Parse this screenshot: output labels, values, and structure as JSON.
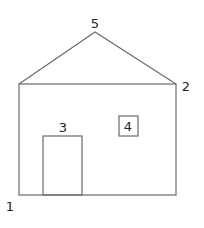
{
  "diagram": {
    "title": "",
    "stroke_color": "#6b6b6b",
    "label_color": "#222222",
    "shapes": {
      "wall": {
        "x": 19,
        "y": 84,
        "width": 157,
        "height": 111
      },
      "roof": {
        "points": [
          [
            19,
            84
          ],
          [
            95,
            32
          ],
          [
            176,
            84
          ]
        ]
      },
      "door": {
        "x": 43,
        "y": 136,
        "width": 39,
        "height": 59
      },
      "window": {
        "x": 119,
        "y": 116,
        "width": 19,
        "height": 20
      }
    },
    "labels": [
      {
        "id": "1",
        "text": "1",
        "x": 10,
        "y": 211,
        "anchor": "middle",
        "refers_to": "bottom-left corner"
      },
      {
        "id": "2",
        "text": "2",
        "x": 186,
        "y": 91,
        "anchor": "middle",
        "refers_to": "right eave corner"
      },
      {
        "id": "3",
        "text": "3",
        "x": 63,
        "y": 132,
        "anchor": "middle",
        "refers_to": "door"
      },
      {
        "id": "4",
        "text": "4",
        "x": 128,
        "y": 131,
        "anchor": "middle",
        "refers_to": "window"
      },
      {
        "id": "5",
        "text": "5",
        "x": 95,
        "y": 28,
        "anchor": "middle",
        "refers_to": "roof apex"
      }
    ]
  }
}
